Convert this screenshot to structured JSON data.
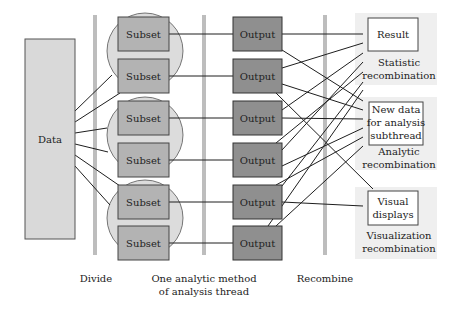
{
  "diagram": {
    "data_box": {
      "label": "Data"
    },
    "subsets": [
      {
        "label": "Subset"
      },
      {
        "label": "Subset"
      },
      {
        "label": "Subset"
      },
      {
        "label": "Subset"
      },
      {
        "label": "Subset"
      },
      {
        "label": "Subset"
      }
    ],
    "outputs": [
      {
        "label": "Output"
      },
      {
        "label": "Output"
      },
      {
        "label": "Output"
      },
      {
        "label": "Output"
      },
      {
        "label": "Output"
      },
      {
        "label": "Output"
      }
    ],
    "results": {
      "result": {
        "label": "Result",
        "group_caption": [
          "Statistic",
          "recombination"
        ]
      },
      "new_data": {
        "label": [
          "New data",
          "for analysis",
          "subthread"
        ],
        "group_caption": [
          "Analytic",
          "recombination"
        ]
      },
      "visual": {
        "label": [
          "Visual",
          "displays"
        ],
        "group_caption": [
          "Visualization",
          "recombination"
        ]
      }
    },
    "stage_labels": {
      "divide": "Divide",
      "analysis": [
        "One analytic method",
        "of analysis thread"
      ],
      "recombine": "Recombine"
    },
    "colors": {
      "data_fill": "#d9d9d9",
      "subset_fill": "#b3b3b3",
      "output_fill": "#8f8f8f",
      "circle_fill": "#dcdcdc",
      "bar": "#bdbdbd",
      "group_bg": "#efefef",
      "line": "#1e1e1e"
    }
  }
}
